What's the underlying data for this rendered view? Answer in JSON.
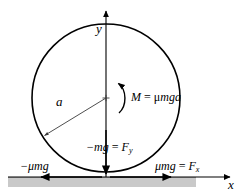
{
  "figure": {
    "type": "physics-free-body-diagram",
    "width": 244,
    "height": 195
  },
  "colors": {
    "stroke": "#000000",
    "background": "#ffffff",
    "ground_fill": "#c9c9c9",
    "ground_line": "#555555",
    "thin_line": "#3a3a3a"
  },
  "axes": {
    "y_label": "y",
    "x_label": "x",
    "y_axis": {
      "x": 106,
      "y_top": 8,
      "y_bottom": 177,
      "arrow": "up"
    },
    "x_axis": {
      "y": 177,
      "x_left": 8,
      "x_right": 234,
      "arrow": "right"
    }
  },
  "body": {
    "shape": "circle",
    "center_x": 106,
    "center_y": 98,
    "radius": 74
  },
  "radius_annotation": {
    "label": "a",
    "from_x": 106,
    "from_y": 98,
    "to_x": 44,
    "to_y": 136,
    "arrow": "outward"
  },
  "moment": {
    "label_M": "M",
    "label_equals": " = ",
    "label_mu": "μ",
    "label_mga": "mga",
    "full_label": "M = μmga",
    "direction": "counterclockwise"
  },
  "forces": [
    {
      "name": "normal-weight",
      "label_main": "−mg",
      "label_equals": " = ",
      "label_symbol": "F",
      "label_subscript": "y",
      "full_label": "−mg = F_y",
      "direction": "down",
      "arrow_x": 106,
      "arrow_from_y": 128,
      "arrow_to_y": 174
    },
    {
      "name": "friction-left",
      "label_main": "−μmg",
      "full_label": "−μmg",
      "direction": "left",
      "arrow_y": 177,
      "arrow_from_x": 102,
      "arrow_to_x": 40
    },
    {
      "name": "friction-right",
      "label_main": "μmg",
      "label_equals": " = ",
      "label_symbol": "F",
      "label_subscript": "x",
      "full_label": "μmg = F_x",
      "direction": "right",
      "arrow_y": 177,
      "arrow_from_x": 110,
      "arrow_to_x": 172
    }
  ],
  "ground": {
    "name": "ground-surface",
    "top_y": 177,
    "bottom_y": 186,
    "x_left": 8,
    "x_right": 196
  }
}
